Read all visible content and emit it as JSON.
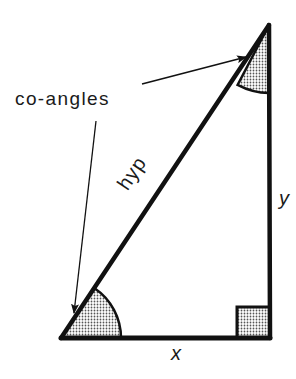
{
  "diagram": {
    "labels": {
      "coangles": "co-angles",
      "hypotenuse": "hyp",
      "vertical_side": "y",
      "horizontal_side": "x"
    },
    "vertices": {
      "bottom_left": [
        61,
        338
      ],
      "right_angle": [
        270,
        338
      ],
      "top": [
        269,
        25
      ]
    },
    "annotations": {
      "angle_shading": "dotted",
      "right_angle_marker": "shaded-square",
      "arrows_point_to": [
        "top-angle",
        "bottom-left-angle"
      ]
    },
    "colors": {
      "stroke": "#111111",
      "shade_fill": "#c8c8c8",
      "background": "#ffffff"
    }
  }
}
